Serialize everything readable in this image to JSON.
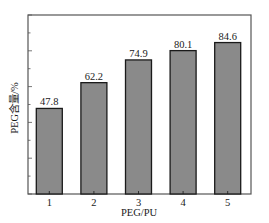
{
  "chart_data": {
    "type": "bar",
    "title": "",
    "xlabel": "PEG/PU",
    "ylabel": "PEG含量/%",
    "categories": [
      "1",
      "2",
      "3",
      "4",
      "5"
    ],
    "values": [
      47.8,
      62.2,
      74.9,
      80.1,
      84.6
    ],
    "data_labels": [
      "47.8",
      "62.2",
      "74.9",
      "80.1",
      "84.6"
    ],
    "ylim": [
      0,
      100
    ],
    "y_tick_labels_shown": false,
    "grid": false,
    "legend": null,
    "colors": {
      "bar_fill": "#8a8a8a",
      "bar_edge": "#1a1a1a",
      "frame": "#555555",
      "background": "#ffffff"
    }
  }
}
